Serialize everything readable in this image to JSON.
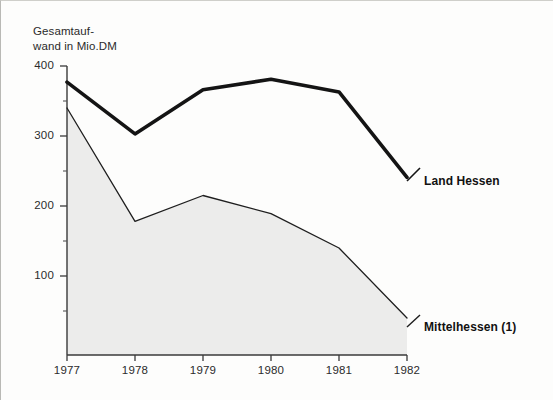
{
  "chart_data": {
    "type": "line",
    "title_line1": "Gesamtauf-",
    "title_line2": "wand in Mio.DM",
    "xlabel": "",
    "ylabel": "Gesamtaufwand in Mio.DM",
    "categories": [
      "1977",
      "1978",
      "1979",
      "1980",
      "1981",
      "1982"
    ],
    "x": [
      1977,
      1978,
      1979,
      1980,
      1981,
      1982
    ],
    "ylim": [
      0,
      400
    ],
    "xlim": [
      1977,
      1982
    ],
    "yticks": [
      "400",
      "300",
      "200",
      "100"
    ],
    "ytick_values": [
      400,
      300,
      200,
      100
    ],
    "yminor_ticks": [
      50,
      150,
      250,
      350
    ],
    "grid": false,
    "legend_position": "right-inline",
    "series": [
      {
        "name": "Land Hessen",
        "values": [
          377,
          303,
          366,
          381,
          363,
          241
        ],
        "style": "thick-line",
        "color": "#141414",
        "fill": "none",
        "label_x": 424,
        "label_y": 174
      },
      {
        "name": "Mittelhessen (1)",
        "values": [
          340,
          178,
          215,
          189,
          140,
          40
        ],
        "style": "thin-line-filled",
        "color": "#1e1e1e",
        "fill": "#ececeb",
        "label_x": 424,
        "label_y": 320
      }
    ],
    "annotations": []
  },
  "colors": {
    "background": "#fdfdfc",
    "axis": "#2e2e2e",
    "thick_series": "#141414",
    "thin_series": "#1e1e1e",
    "area_fill": "#ececeb",
    "text": "#2b2b2b"
  }
}
